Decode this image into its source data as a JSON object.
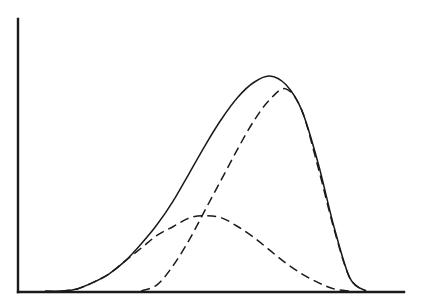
{
  "chart_data": {
    "type": "line",
    "title": "",
    "xlabel": "",
    "ylabel": "",
    "grid": false,
    "legend": null,
    "axes": {
      "x_ticks": [],
      "y_ticks": []
    },
    "x": [
      0,
      0.05,
      0.1,
      0.15,
      0.2,
      0.25,
      0.3,
      0.35,
      0.4,
      0.45,
      0.5,
      0.55,
      0.6,
      0.65,
      0.7,
      0.75,
      0.8,
      0.85,
      0.9,
      0.95,
      1.0
    ],
    "series": [
      {
        "name": "total",
        "style": "solid",
        "values": [
          0,
          0,
          0.01,
          0.04,
          0.08,
          0.14,
          0.22,
          0.31,
          0.42,
          0.55,
          0.68,
          0.8,
          0.9,
          0.97,
          1.0,
          0.96,
          0.84,
          0.6,
          0.3,
          0.06,
          0
        ]
      },
      {
        "name": "component-1",
        "style": "dashed",
        "values": [
          0,
          0,
          0.01,
          0.04,
          0.08,
          0.14,
          0.2,
          0.26,
          0.3,
          0.34,
          0.35,
          0.34,
          0.3,
          0.25,
          0.19,
          0.13,
          0.08,
          0.04,
          0.01,
          0,
          0
        ]
      },
      {
        "name": "component-2",
        "style": "dashed",
        "values": [
          0,
          0,
          0,
          0,
          0,
          0,
          0,
          0.03,
          0.12,
          0.24,
          0.38,
          0.52,
          0.66,
          0.79,
          0.89,
          0.94,
          0.84,
          0.58,
          0.29,
          0.06,
          0
        ]
      }
    ]
  },
  "plot_geometry": {
    "origin_x": 18,
    "origin_y": 292,
    "y_axis_top": 19,
    "x_axis_right": 404,
    "curve_x_start": 45,
    "curve_x_end": 366,
    "peak_y_pixel": 76
  }
}
